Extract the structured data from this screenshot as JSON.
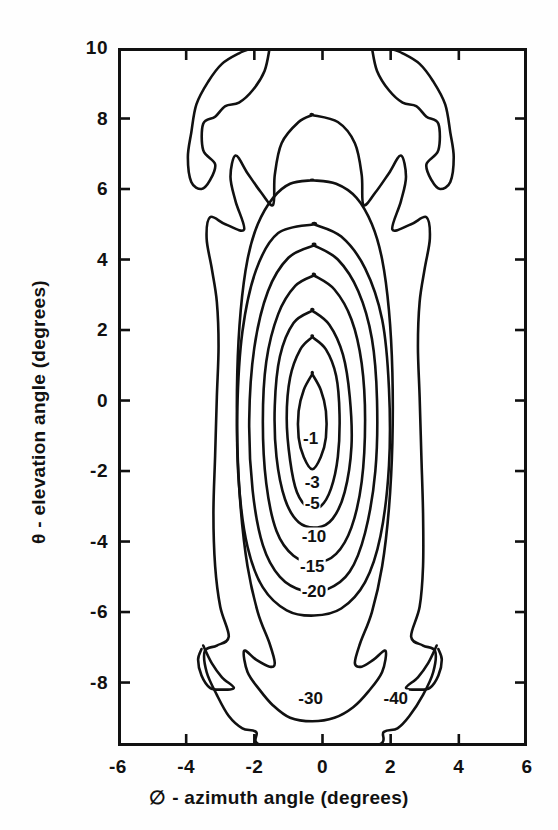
{
  "figure": {
    "kind": "contour-plot",
    "background_color": "#ffffff",
    "line_color": "#111111"
  },
  "axes": {
    "x_title": "∅ - azimuth angle (degrees)",
    "y_title": "θ - elevation angle (degrees)",
    "x_ticks": [
      "-6",
      "-4",
      "-2",
      "0",
      "2",
      "4",
      "6"
    ],
    "y_ticks": [
      "10",
      "8",
      "6",
      "4",
      "2",
      "0",
      "-2",
      "-4",
      "-6",
      "-8"
    ]
  },
  "chart_data": {
    "type": "line",
    "title": "",
    "subtitle": "",
    "xlabel": "∅ - azimuth angle (degrees)",
    "ylabel": "θ - elevation angle (degrees)",
    "xlim": [
      -6,
      6
    ],
    "ylim": [
      -9.8,
      10
    ],
    "xticks": [
      -6,
      -4,
      -2,
      0,
      2,
      4,
      6
    ],
    "yticks": [
      10,
      8,
      6,
      4,
      2,
      0,
      -2,
      -4,
      -6,
      -8
    ],
    "grid": false,
    "legend": "none",
    "units": "dB",
    "contour_levels": [
      -1,
      -3,
      -5,
      -10,
      -15,
      -20,
      -30,
      -40
    ],
    "peak": {
      "x": -0.3,
      "y": -0.5
    },
    "annotations": [
      {
        "text": "-1",
        "x": -0.35,
        "y": -1.05
      },
      {
        "text": "-3",
        "x": -0.3,
        "y": -2.3
      },
      {
        "text": "-5",
        "x": -0.3,
        "y": -2.9
      },
      {
        "text": "-10",
        "x": -0.25,
        "y": -3.85
      },
      {
        "text": "-15",
        "x": -0.3,
        "y": -4.7
      },
      {
        "text": "-20",
        "x": -0.25,
        "y": -5.4
      },
      {
        "text": "-30",
        "x": -0.35,
        "y": -8.45
      },
      {
        "text": "-40",
        "x": 2.15,
        "y": -8.45
      }
    ],
    "series": [
      {
        "name": "-1 dB",
        "level": -1,
        "points": [
          [
            -0.3,
            0.75
          ],
          [
            -0.05,
            0.3
          ],
          [
            0.1,
            -0.3
          ],
          [
            0.1,
            -1.05
          ],
          [
            -0.05,
            -1.6
          ],
          [
            -0.3,
            -1.95
          ],
          [
            -0.55,
            -1.6
          ],
          [
            -0.7,
            -1.05
          ],
          [
            -0.7,
            -0.3
          ],
          [
            -0.55,
            0.3
          ],
          [
            -0.3,
            0.75
          ]
        ]
      },
      {
        "name": "-3 dB",
        "level": -3,
        "points": [
          [
            -0.3,
            1.8
          ],
          [
            0.1,
            1.45
          ],
          [
            0.4,
            0.7
          ],
          [
            0.5,
            -0.4
          ],
          [
            0.45,
            -1.6
          ],
          [
            0.25,
            -2.5
          ],
          [
            -0.05,
            -3.0
          ],
          [
            -0.4,
            -3.05
          ],
          [
            -0.75,
            -2.6
          ],
          [
            -0.95,
            -1.7
          ],
          [
            -1.05,
            -0.5
          ],
          [
            -0.95,
            0.65
          ],
          [
            -0.65,
            1.45
          ],
          [
            -0.3,
            1.8
          ]
        ]
      },
      {
        "name": "-5 dB",
        "level": -5,
        "points": [
          [
            -0.3,
            2.55
          ],
          [
            0.2,
            2.15
          ],
          [
            0.6,
            1.3
          ],
          [
            0.8,
            0.1
          ],
          [
            0.85,
            -1.3
          ],
          [
            0.65,
            -2.6
          ],
          [
            0.3,
            -3.35
          ],
          [
            -0.15,
            -3.6
          ],
          [
            -0.7,
            -3.45
          ],
          [
            -1.1,
            -2.8
          ],
          [
            -1.35,
            -1.6
          ],
          [
            -1.4,
            -0.15
          ],
          [
            -1.25,
            1.25
          ],
          [
            -0.85,
            2.2
          ],
          [
            -0.3,
            2.55
          ]
        ]
      },
      {
        "name": "-10 dB",
        "level": -10,
        "points": [
          [
            -0.25,
            3.55
          ],
          [
            0.35,
            3.15
          ],
          [
            0.85,
            2.3
          ],
          [
            1.15,
            1.05
          ],
          [
            1.25,
            -0.55
          ],
          [
            1.15,
            -2.3
          ],
          [
            0.85,
            -3.6
          ],
          [
            0.4,
            -4.35
          ],
          [
            -0.2,
            -4.6
          ],
          [
            -0.85,
            -4.4
          ],
          [
            -1.35,
            -3.7
          ],
          [
            -1.65,
            -2.35
          ],
          [
            -1.75,
            -0.6
          ],
          [
            -1.65,
            1.1
          ],
          [
            -1.3,
            2.45
          ],
          [
            -0.8,
            3.25
          ],
          [
            -0.25,
            3.55
          ]
        ]
      },
      {
        "name": "-15 dB",
        "level": -15,
        "points": [
          [
            -0.25,
            4.4
          ],
          [
            0.45,
            4.0
          ],
          [
            1.05,
            3.1
          ],
          [
            1.45,
            1.75
          ],
          [
            1.6,
            0.0
          ],
          [
            1.55,
            -2.0
          ],
          [
            1.25,
            -3.75
          ],
          [
            0.8,
            -4.85
          ],
          [
            0.15,
            -5.35
          ],
          [
            -0.55,
            -5.4
          ],
          [
            -1.25,
            -5.0
          ],
          [
            -1.75,
            -4.1
          ],
          [
            -2.05,
            -2.55
          ],
          [
            -2.15,
            -0.55
          ],
          [
            -2.0,
            1.5
          ],
          [
            -1.6,
            3.1
          ],
          [
            -1.0,
            4.05
          ],
          [
            -0.25,
            4.4
          ]
        ]
      },
      {
        "name": "-20 dB",
        "level": -20,
        "points": [
          [
            -0.25,
            5.0
          ],
          [
            0.55,
            4.65
          ],
          [
            1.25,
            3.75
          ],
          [
            1.75,
            2.3
          ],
          [
            1.95,
            0.35
          ],
          [
            1.95,
            -1.85
          ],
          [
            1.7,
            -3.85
          ],
          [
            1.25,
            -5.15
          ],
          [
            0.55,
            -5.9
          ],
          [
            -0.25,
            -6.1
          ],
          [
            -1.05,
            -5.95
          ],
          [
            -1.75,
            -5.3
          ],
          [
            -2.2,
            -4.15
          ],
          [
            -2.45,
            -2.4
          ],
          [
            -2.5,
            -0.3
          ],
          [
            -2.35,
            1.95
          ],
          [
            -1.95,
            3.7
          ],
          [
            -1.3,
            4.75
          ],
          [
            -0.25,
            5.0
          ]
        ]
      },
      {
        "name": "-30 dB",
        "level": -30,
        "points": [
          [
            -0.3,
            6.25
          ],
          [
            0.4,
            6.15
          ],
          [
            1.0,
            5.75
          ],
          [
            1.45,
            5.0
          ],
          [
            1.75,
            4.0
          ],
          [
            1.95,
            2.55
          ],
          [
            2.05,
            0.8
          ],
          [
            2.05,
            -1.2
          ],
          [
            1.95,
            -3.05
          ],
          [
            1.75,
            -4.7
          ],
          [
            1.45,
            -6.0
          ],
          [
            1.1,
            -6.9
          ],
          [
            0.95,
            -7.45
          ],
          [
            1.15,
            -7.55
          ],
          [
            1.5,
            -7.35
          ],
          [
            1.85,
            -7.1
          ],
          [
            1.75,
            -7.7
          ],
          [
            1.35,
            -8.25
          ],
          [
            0.9,
            -8.7
          ],
          [
            0.35,
            -9.0
          ],
          [
            -0.3,
            -9.1
          ],
          [
            -0.95,
            -9.0
          ],
          [
            -1.45,
            -8.65
          ],
          [
            -1.85,
            -8.2
          ],
          [
            -2.2,
            -7.7
          ],
          [
            -2.3,
            -7.1
          ],
          [
            -1.95,
            -7.35
          ],
          [
            -1.55,
            -7.55
          ],
          [
            -1.4,
            -7.45
          ],
          [
            -1.55,
            -6.9
          ],
          [
            -1.9,
            -6.0
          ],
          [
            -2.2,
            -4.7
          ],
          [
            -2.4,
            -3.05
          ],
          [
            -2.5,
            -1.2
          ],
          [
            -2.5,
            0.8
          ],
          [
            -2.4,
            2.55
          ],
          [
            -2.2,
            4.0
          ],
          [
            -1.9,
            5.0
          ],
          [
            -1.45,
            5.75
          ],
          [
            -0.95,
            6.15
          ],
          [
            -0.3,
            6.25
          ]
        ]
      },
      {
        "name": "-40 dB outer",
        "level": -40,
        "points": [
          [
            -0.3,
            8.1
          ],
          [
            0.45,
            7.9
          ],
          [
            0.95,
            7.3
          ],
          [
            1.15,
            6.4
          ],
          [
            1.2,
            5.55
          ],
          [
            1.55,
            5.9
          ],
          [
            1.95,
            6.45
          ],
          [
            2.3,
            6.95
          ],
          [
            2.45,
            6.35
          ],
          [
            2.3,
            5.65
          ],
          [
            2.05,
            4.85
          ],
          [
            2.6,
            5.0
          ],
          [
            3.05,
            5.2
          ],
          [
            3.15,
            4.6
          ],
          [
            3.0,
            3.75
          ],
          [
            2.85,
            2.8
          ],
          [
            2.8,
            1.55
          ],
          [
            2.85,
            0.1
          ],
          [
            2.9,
            -1.55
          ],
          [
            2.95,
            -3.2
          ],
          [
            2.95,
            -4.7
          ],
          [
            2.85,
            -5.85
          ],
          [
            2.6,
            -6.7
          ],
          [
            2.95,
            -6.95
          ],
          [
            3.3,
            -7.1
          ],
          [
            3.25,
            -7.7
          ],
          [
            2.95,
            -8.35
          ],
          [
            2.55,
            -8.95
          ],
          [
            2.2,
            -9.3
          ],
          [
            1.8,
            -9.4
          ],
          [
            1.45,
            -9.8
          ],
          [
            -1.65,
            -9.8
          ],
          [
            -1.95,
            -9.4
          ],
          [
            -2.35,
            -9.3
          ],
          [
            -2.75,
            -8.95
          ],
          [
            -3.1,
            -8.35
          ],
          [
            -3.4,
            -7.7
          ],
          [
            -3.45,
            -7.1
          ],
          [
            -3.1,
            -6.95
          ],
          [
            -2.75,
            -6.7
          ],
          [
            -3.0,
            -5.85
          ],
          [
            -3.15,
            -4.7
          ],
          [
            -3.2,
            -3.2
          ],
          [
            -3.15,
            -1.55
          ],
          [
            -3.1,
            0.1
          ],
          [
            -3.05,
            1.55
          ],
          [
            -3.1,
            2.8
          ],
          [
            -3.25,
            3.75
          ],
          [
            -3.4,
            4.6
          ],
          [
            -3.3,
            5.2
          ],
          [
            -2.85,
            5.0
          ],
          [
            -2.3,
            4.85
          ],
          [
            -2.55,
            5.65
          ],
          [
            -2.7,
            6.35
          ],
          [
            -2.55,
            6.95
          ],
          [
            -2.2,
            6.45
          ],
          [
            -1.8,
            5.9
          ],
          [
            -1.45,
            5.55
          ],
          [
            -1.4,
            6.4
          ],
          [
            -1.2,
            7.3
          ],
          [
            -0.7,
            7.9
          ],
          [
            -0.3,
            8.1
          ]
        ]
      },
      {
        "name": "-40 dB upper-left spur",
        "level": -40,
        "points": [
          [
            -1.55,
            10.0
          ],
          [
            -1.7,
            9.35
          ],
          [
            -2.05,
            8.8
          ],
          [
            -2.45,
            8.45
          ],
          [
            -2.85,
            8.35
          ],
          [
            -3.15,
            8.05
          ],
          [
            -3.5,
            7.85
          ],
          [
            -3.5,
            7.1
          ],
          [
            -3.15,
            6.7
          ],
          [
            -3.3,
            6.25
          ],
          [
            -3.55,
            6.0
          ],
          [
            -3.85,
            6.2
          ],
          [
            -3.95,
            6.9
          ],
          [
            -3.85,
            7.6
          ],
          [
            -3.7,
            8.4
          ],
          [
            -3.35,
            9.05
          ],
          [
            -2.95,
            9.55
          ],
          [
            -2.45,
            9.85
          ],
          [
            -2.05,
            10.0
          ]
        ]
      },
      {
        "name": "-40 dB upper-right spur",
        "level": -40,
        "points": [
          [
            1.45,
            10.0
          ],
          [
            1.6,
            9.35
          ],
          [
            1.95,
            8.8
          ],
          [
            2.35,
            8.45
          ],
          [
            2.75,
            8.35
          ],
          [
            3.05,
            8.05
          ],
          [
            3.4,
            7.85
          ],
          [
            3.4,
            7.1
          ],
          [
            3.05,
            6.7
          ],
          [
            3.2,
            6.25
          ],
          [
            3.45,
            6.0
          ],
          [
            3.75,
            6.2
          ],
          [
            3.85,
            6.9
          ],
          [
            3.75,
            7.6
          ],
          [
            3.6,
            8.4
          ],
          [
            3.25,
            9.05
          ],
          [
            2.85,
            9.55
          ],
          [
            2.35,
            9.85
          ],
          [
            1.95,
            10.0
          ]
        ]
      },
      {
        "name": "-40 dB lower-left spur",
        "level": -40,
        "points": [
          [
            -3.5,
            -6.95
          ],
          [
            -3.25,
            -7.45
          ],
          [
            -2.95,
            -7.85
          ],
          [
            -2.6,
            -8.15
          ],
          [
            -2.95,
            -8.2
          ],
          [
            -3.3,
            -8.15
          ],
          [
            -3.55,
            -7.8
          ],
          [
            -3.65,
            -7.35
          ],
          [
            -3.55,
            -7.05
          ]
        ]
      },
      {
        "name": "-40 dB lower-right spur",
        "level": -40,
        "points": [
          [
            3.35,
            -6.95
          ],
          [
            3.1,
            -7.45
          ],
          [
            2.8,
            -7.85
          ],
          [
            2.45,
            -8.15
          ],
          [
            2.8,
            -8.2
          ],
          [
            3.15,
            -8.15
          ],
          [
            3.4,
            -7.8
          ],
          [
            3.5,
            -7.35
          ],
          [
            3.4,
            -7.05
          ]
        ]
      }
    ]
  }
}
